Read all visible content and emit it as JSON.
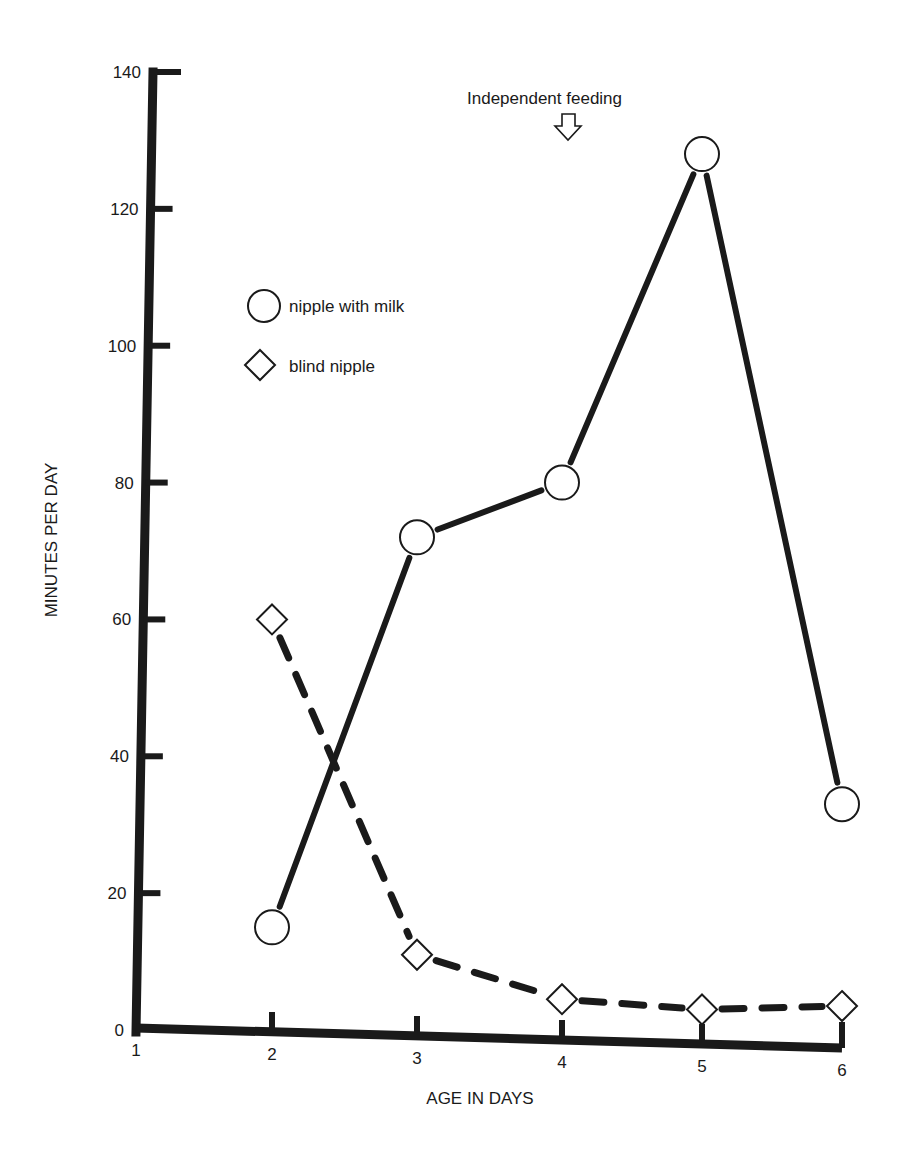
{
  "chart_data": {
    "type": "line",
    "title": "",
    "xlabel": "AGE IN DAYS",
    "ylabel": "MINUTES PER DAY",
    "x": [
      2,
      3,
      4,
      5,
      6
    ],
    "x_ticks": [
      "1",
      "2",
      "3",
      "4",
      "5",
      "6"
    ],
    "y_ticks": [
      "0",
      "20",
      "40",
      "60",
      "80",
      "100",
      "120",
      "140"
    ],
    "xlim": [
      1,
      6
    ],
    "ylim": [
      0,
      140
    ],
    "grid": false,
    "legend_position": "upper-left",
    "series": [
      {
        "name": "nipple with milk",
        "marker": "circle",
        "line": "solid",
        "values": [
          15,
          72,
          80,
          128,
          33
        ]
      },
      {
        "name": "blind nipple",
        "marker": "diamond",
        "line": "dashed",
        "values": [
          60,
          11,
          4.5,
          3,
          3.5
        ]
      }
    ],
    "annotations": [
      {
        "text": "Independent feeding",
        "x": 4,
        "arrow": "down-outline-arrow"
      }
    ]
  },
  "legend": {
    "items": [
      {
        "label": "nipple with milk",
        "marker": "circle"
      },
      {
        "label": "blind nipple",
        "marker": "diamond"
      }
    ]
  },
  "annotation": {
    "text": "Independent feeding"
  },
  "colors": {
    "ink": "#1a1a1a",
    "background": "#ffffff"
  }
}
